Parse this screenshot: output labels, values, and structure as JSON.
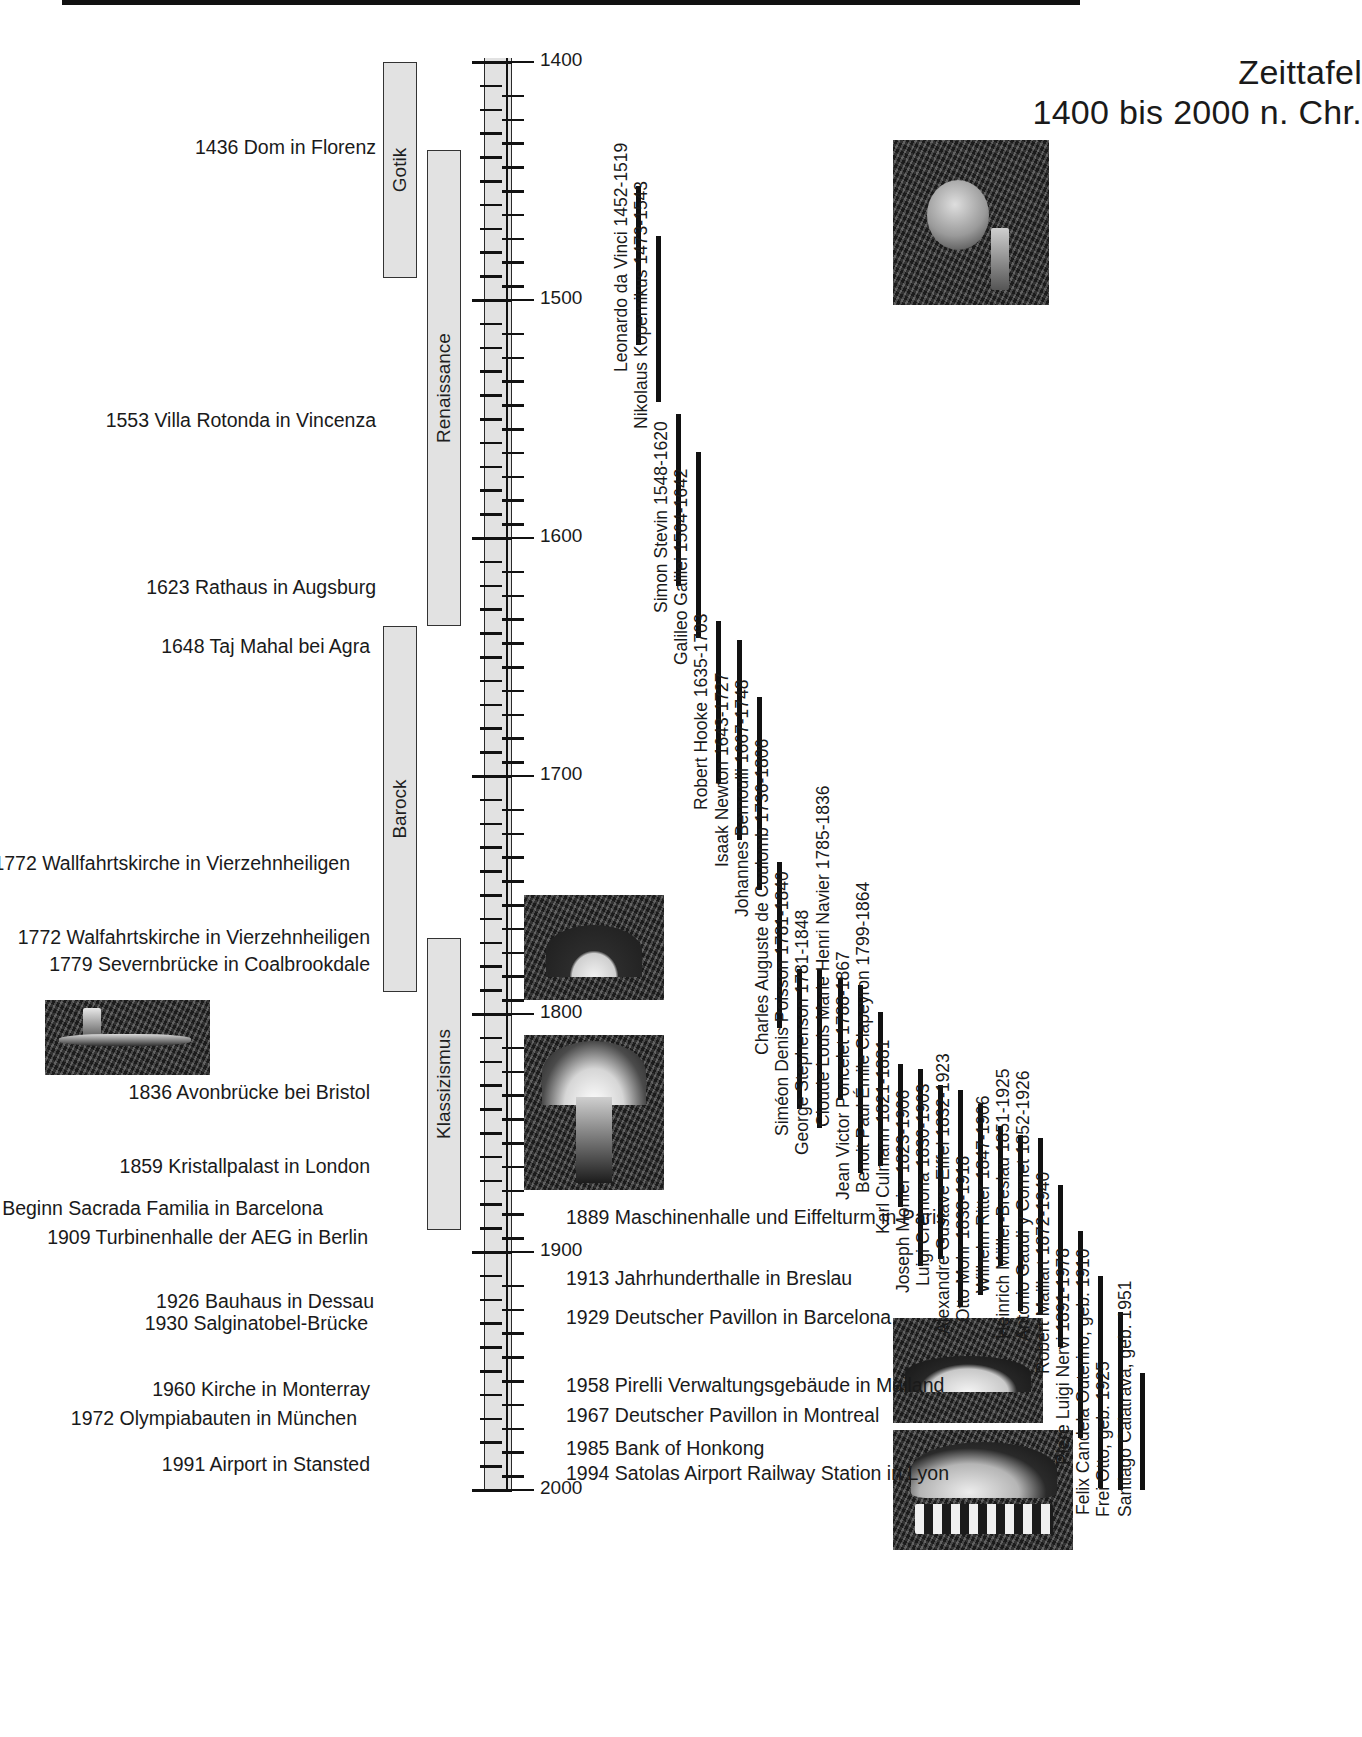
{
  "title": {
    "line1": "Zeittafel",
    "line2": "1400 bis 2000 n. Chr."
  },
  "axis": {
    "range": [
      1400,
      2000
    ],
    "tick_labels": [
      "1400",
      "1500",
      "1600",
      "1700",
      "1800",
      "1900",
      "2000"
    ]
  },
  "eras": [
    {
      "label": "Gotik",
      "start": 1400,
      "end": 1490
    },
    {
      "label": "Renaissance",
      "start": 1437,
      "end": 1636
    },
    {
      "label": "Barock",
      "start": 1637,
      "end": 1790
    },
    {
      "label": "Klassizismus",
      "start": 1768,
      "end": 1890
    }
  ],
  "events_left": [
    {
      "year": "1436",
      "text": "Dom in Florenz"
    },
    {
      "year": "1553",
      "text": "Villa Rotonda in Vincenza"
    },
    {
      "year": "1623",
      "text": "Rathaus in Augsburg"
    },
    {
      "year": "1648",
      "text": "Taj Mahal bei Agra"
    },
    {
      "year": "1772",
      "text": "Wallfahrtskirche in Vierzehnheiligen"
    },
    {
      "year": "1772",
      "text": "Walfahrtskirche in Vierzehnheiligen"
    },
    {
      "year": "1779",
      "text": "Severnbrücke in Coalbrookdale"
    },
    {
      "year": "1836",
      "text": "Avonbrücke bei Bristol"
    },
    {
      "year": "1859",
      "text": "Kristallpalast in London"
    },
    {
      "year": "1883",
      "text": "Beginn Sacrada Familia in Barcelona"
    },
    {
      "year": "1909",
      "text": "Turbinenhalle der AEG in Berlin"
    },
    {
      "year": "1926",
      "text": "Bauhaus in Dessau"
    },
    {
      "year": "1930",
      "text": "Salginatobel-Brücke"
    },
    {
      "year": "1960",
      "text": "Kirche in Monterray"
    },
    {
      "year": "1972",
      "text": "Olympiabauten in München"
    },
    {
      "year": "1991",
      "text": "Airport in Stansted"
    }
  ],
  "events_right": [
    {
      "year": "1889",
      "text": "Maschinenhalle und Eiffelturm in Paris"
    },
    {
      "year": "1913",
      "text": "Jahrhunderthalle in Breslau"
    },
    {
      "year": "1929",
      "text": "Deutscher Pavillon in Barcelona"
    },
    {
      "year": "1958",
      "text": "Pirelli Verwaltungsgebäude in Mailand"
    },
    {
      "year": "1967",
      "text": "Deutscher Pavillon in Montreal"
    },
    {
      "year": "1985",
      "text": "Bank of Honkong"
    },
    {
      "year": "1994",
      "text": "Satolas Airport Railway Station in Lyon"
    }
  ],
  "people": [
    {
      "name": "Leonardo da Vinci 1452-1519",
      "born": 1452,
      "died": 1519
    },
    {
      "name": "Nikolaus Kopernikus 1473-1543",
      "born": 1473,
      "died": 1543
    },
    {
      "name": "Simon Stevin 1548-1620",
      "born": 1548,
      "died": 1620
    },
    {
      "name": "Galileo Galilei 1564-1642",
      "born": 1564,
      "died": 1642
    },
    {
      "name": "Robert Hooke 1635-1703",
      "born": 1635,
      "died": 1703
    },
    {
      "name": "Isaak Newton 1643-1727",
      "born": 1643,
      "died": 1727
    },
    {
      "name": "Johannes Bernoulli 1667-1748",
      "born": 1667,
      "died": 1748
    },
    {
      "name": "Charles Auguste de Coulomb 1736-1806",
      "born": 1736,
      "died": 1806
    },
    {
      "name": "Siméon Denis Poisson 1781-1840",
      "born": 1781,
      "died": 1840
    },
    {
      "name": "George Stephenson 1781-1848",
      "born": 1781,
      "died": 1848
    },
    {
      "name": "Cloude Louis Marie Henri Navier 1785-1836",
      "born": 1785,
      "died": 1836
    },
    {
      "name": "Jean Victor Poncelet 1788-1867",
      "born": 1788,
      "died": 1867
    },
    {
      "name": "Benoit Paul Émile Clapeyron 1799-1864",
      "born": 1799,
      "died": 1864
    },
    {
      "name": "Karl Culmann 1821-1881",
      "born": 1821,
      "died": 1881
    },
    {
      "name": "Joseph Monier 1823-1906",
      "born": 1823,
      "died": 1906
    },
    {
      "name": "Luigi Cremona 1830-1903",
      "born": 1830,
      "died": 1903
    },
    {
      "name": "Alexandre Gustave Eiffel 1832-1923",
      "born": 1832,
      "died": 1923
    },
    {
      "name": "Otto Mohr 1838-1918",
      "born": 1838,
      "died": 1918
    },
    {
      "name": "Wilhelm Ritter 1847-1906",
      "born": 1847,
      "died": 1906
    },
    {
      "name": "Heinrich Müller-Breslau 1851-1925",
      "born": 1851,
      "died": 1925
    },
    {
      "name": "Antonio Gaudi y Cornet 1852-1926",
      "born": 1852,
      "died": 1926
    },
    {
      "name": "Robert Maillart 1872-1940",
      "born": 1872,
      "died": 1940
    },
    {
      "name": "Piere Luigi Nervi 1891-1978",
      "born": 1891,
      "died": 1978
    },
    {
      "name": "Felix Candela Outerino, geb. 1910",
      "born": 1910,
      "died": 1999
    },
    {
      "name": "Frei Otto, geb. 1925",
      "born": 1925,
      "died": 2000
    },
    {
      "name": "Santiago Calatrava, geb. 1951",
      "born": 1951,
      "died": 2000
    }
  ],
  "photos": [
    {
      "name": "dom-in-florenz-photo"
    },
    {
      "name": "severnbruecke-photo"
    },
    {
      "name": "avonbruecke-photo"
    },
    {
      "name": "kristallpalast-photo"
    },
    {
      "name": "salginatobel-bruecke-photo"
    },
    {
      "name": "satolas-station-photo"
    }
  ]
}
